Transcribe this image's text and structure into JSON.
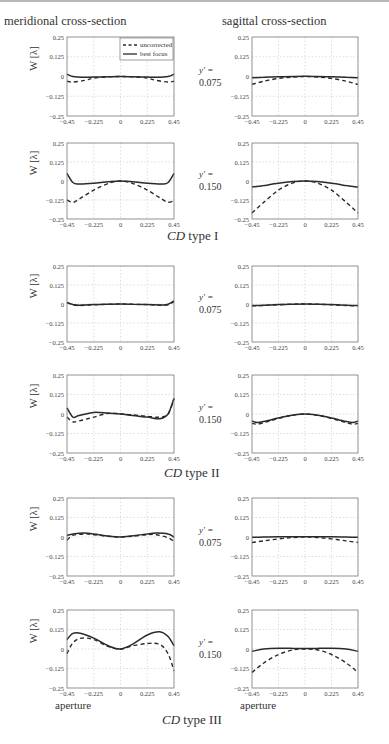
{
  "header": {
    "left_column": "meridional cross-section",
    "right_column": "sagittal cross-section"
  },
  "legend": {
    "uncorrected": "uncorrected",
    "best_focus": "best focus"
  },
  "axis": {
    "ylabel": "W [λ]",
    "xlabel": "aperture",
    "yticks": [
      "0.25",
      "0.125",
      "0",
      "−0.125",
      "−0.25"
    ],
    "xticks": [
      "−0.45",
      "−0.225",
      "0",
      "0.225",
      "0.45"
    ]
  },
  "captions": {
    "type1": {
      "italic": "CD",
      "rest": " type I"
    },
    "type2": {
      "italic": "CD",
      "rest": " type II"
    },
    "type3": {
      "italic": "CD",
      "rest": " type III"
    }
  },
  "yprime": {
    "label": "y′ =",
    "v1": "0.075",
    "v2": "0.150"
  },
  "chart_data": [
    {
      "type": "line",
      "title": "CD type I, meridional, y' = 0.075",
      "xlabel": "",
      "ylabel": "W [λ]",
      "xlim": [
        -0.45,
        0.45
      ],
      "ylim": [
        -0.25,
        0.25
      ],
      "grid": true,
      "legend_position": "upper right",
      "x": [
        -0.45,
        -0.4,
        -0.3,
        -0.225,
        -0.1,
        0,
        0.1,
        0.225,
        0.3,
        0.4,
        0.45
      ],
      "series": [
        {
          "name": "uncorrected",
          "values": [
            -0.03,
            -0.035,
            -0.025,
            -0.01,
            -0.002,
            0,
            -0.002,
            -0.01,
            -0.025,
            -0.035,
            -0.03
          ]
        },
        {
          "name": "best focus",
          "values": [
            0.015,
            0.0,
            -0.005,
            -0.004,
            -0.001,
            0,
            -0.001,
            -0.004,
            -0.005,
            0.0,
            0.015
          ]
        }
      ]
    },
    {
      "type": "line",
      "title": "CD type I, sagittal, y' = 0.075",
      "xlabel": "",
      "ylabel": "",
      "xlim": [
        -0.45,
        0.45
      ],
      "ylim": [
        -0.25,
        0.25
      ],
      "grid": true,
      "x": [
        -0.45,
        -0.35,
        -0.225,
        -0.1,
        0,
        0.1,
        0.225,
        0.35,
        0.45
      ],
      "series": [
        {
          "name": "uncorrected",
          "values": [
            -0.05,
            -0.03,
            -0.012,
            -0.003,
            0,
            -0.003,
            -0.012,
            -0.03,
            -0.05
          ]
        },
        {
          "name": "best focus",
          "values": [
            -0.008,
            -0.005,
            -0.002,
            0.0,
            0.001,
            0.0,
            -0.002,
            -0.005,
            -0.008
          ]
        }
      ]
    },
    {
      "type": "line",
      "title": "CD type I, meridional, y' = 0.150",
      "xlabel": "",
      "ylabel": "W [λ]",
      "xlim": [
        -0.45,
        0.45
      ],
      "ylim": [
        -0.25,
        0.25
      ],
      "grid": true,
      "x": [
        -0.45,
        -0.4,
        -0.35,
        -0.225,
        -0.1,
        0,
        0.1,
        0.225,
        0.35,
        0.4,
        0.45
      ],
      "series": [
        {
          "name": "uncorrected",
          "values": [
            -0.125,
            -0.14,
            -0.12,
            -0.06,
            -0.015,
            0,
            -0.015,
            -0.06,
            -0.12,
            -0.14,
            -0.13
          ]
        },
        {
          "name": "best focus",
          "values": [
            0.05,
            -0.01,
            -0.02,
            -0.015,
            -0.005,
            0,
            -0.005,
            -0.015,
            -0.02,
            -0.01,
            0.05
          ]
        }
      ]
    },
    {
      "type": "line",
      "title": "CD type I, sagittal, y' = 0.150",
      "xlabel": "",
      "ylabel": "",
      "xlim": [
        -0.45,
        0.45
      ],
      "ylim": [
        -0.25,
        0.25
      ],
      "grid": true,
      "x": [
        -0.45,
        -0.35,
        -0.225,
        -0.1,
        0,
        0.1,
        0.225,
        0.35,
        0.45
      ],
      "series": [
        {
          "name": "uncorrected",
          "values": [
            -0.21,
            -0.14,
            -0.06,
            -0.012,
            0,
            -0.012,
            -0.06,
            -0.14,
            -0.21
          ]
        },
        {
          "name": "best focus",
          "values": [
            -0.04,
            -0.03,
            -0.015,
            -0.004,
            0,
            -0.004,
            -0.015,
            -0.03,
            -0.04
          ]
        }
      ]
    },
    {
      "type": "line",
      "title": "CD type II, meridional, y' = 0.075",
      "xlabel": "",
      "ylabel": "W [λ]",
      "xlim": [
        -0.45,
        0.45
      ],
      "ylim": [
        -0.25,
        0.25
      ],
      "grid": true,
      "x": [
        -0.45,
        -0.4,
        -0.35,
        -0.225,
        -0.1,
        0,
        0.1,
        0.225,
        0.35,
        0.4,
        0.45
      ],
      "series": [
        {
          "name": "uncorrected",
          "values": [
            0.01,
            -0.005,
            -0.01,
            -0.005,
            -0.002,
            0,
            -0.002,
            -0.004,
            -0.008,
            -0.005,
            0.015
          ]
        },
        {
          "name": "best focus",
          "values": [
            0.01,
            -0.003,
            -0.008,
            -0.004,
            -0.001,
            0,
            -0.001,
            -0.003,
            -0.006,
            -0.002,
            0.02
          ]
        }
      ]
    },
    {
      "type": "line",
      "title": "CD type II, sagittal, y' = 0.075",
      "xlabel": "",
      "ylabel": "",
      "xlim": [
        -0.45,
        0.45
      ],
      "ylim": [
        -0.25,
        0.25
      ],
      "grid": true,
      "x": [
        -0.45,
        -0.35,
        -0.225,
        -0.1,
        0,
        0.1,
        0.225,
        0.35,
        0.45
      ],
      "series": [
        {
          "name": "uncorrected",
          "values": [
            -0.012,
            -0.01,
            -0.005,
            -0.001,
            0,
            -0.001,
            -0.005,
            -0.01,
            -0.012
          ]
        },
        {
          "name": "best focus",
          "values": [
            -0.01,
            -0.008,
            -0.004,
            -0.001,
            0,
            -0.001,
            -0.004,
            -0.008,
            -0.01
          ]
        }
      ]
    },
    {
      "type": "line",
      "title": "CD type II, meridional, y' = 0.150",
      "xlabel": "",
      "ylabel": "W [λ]",
      "xlim": [
        -0.45,
        0.45
      ],
      "ylim": [
        -0.25,
        0.25
      ],
      "grid": true,
      "x": [
        -0.45,
        -0.4,
        -0.35,
        -0.225,
        -0.1,
        0,
        0.1,
        0.225,
        0.33,
        0.4,
        0.45
      ],
      "series": [
        {
          "name": "uncorrected",
          "values": [
            -0.02,
            -0.05,
            -0.045,
            -0.02,
            0.005,
            0,
            -0.005,
            -0.015,
            -0.02,
            0.0,
            0.1
          ]
        },
        {
          "name": "best focus",
          "values": [
            0.04,
            -0.02,
            -0.01,
            0.01,
            0.005,
            0,
            -0.01,
            -0.02,
            -0.03,
            0.0,
            0.1
          ]
        }
      ]
    },
    {
      "type": "line",
      "title": "CD type II, sagittal, y' = 0.150",
      "xlabel": "",
      "ylabel": "",
      "xlim": [
        -0.45,
        0.45
      ],
      "ylim": [
        -0.25,
        0.25
      ],
      "grid": true,
      "x": [
        -0.45,
        -0.4,
        -0.3,
        -0.15,
        0,
        0.15,
        0.3,
        0.4,
        0.45
      ],
      "series": [
        {
          "name": "uncorrected",
          "values": [
            -0.06,
            -0.065,
            -0.045,
            -0.015,
            0,
            -0.015,
            -0.045,
            -0.065,
            -0.06
          ]
        },
        {
          "name": "best focus",
          "values": [
            -0.045,
            -0.055,
            -0.04,
            -0.012,
            0,
            -0.012,
            -0.04,
            -0.055,
            -0.045
          ]
        }
      ]
    },
    {
      "type": "line",
      "title": "CD type III, meridional, y' = 0.075",
      "xlabel": "",
      "ylabel": "W [λ]",
      "xlim": [
        -0.45,
        0.45
      ],
      "ylim": [
        -0.25,
        0.25
      ],
      "grid": true,
      "x": [
        -0.45,
        -0.4,
        -0.3,
        -0.225,
        -0.1,
        0,
        0.1,
        0.225,
        0.3,
        0.4,
        0.45
      ],
      "series": [
        {
          "name": "uncorrected",
          "values": [
            -0.02,
            0.01,
            0.02,
            0.015,
            0.005,
            0,
            0.005,
            0.015,
            0.015,
            -0.005,
            -0.03
          ]
        },
        {
          "name": "best focus",
          "values": [
            0.01,
            0.02,
            0.025,
            0.02,
            0.005,
            0,
            0.008,
            0.02,
            0.025,
            0.02,
            0.0
          ]
        }
      ]
    },
    {
      "type": "line",
      "title": "CD type III, sagittal, y' = 0.075",
      "xlabel": "",
      "ylabel": "",
      "xlim": [
        -0.45,
        0.45
      ],
      "ylim": [
        -0.25,
        0.25
      ],
      "grid": true,
      "x": [
        -0.45,
        -0.35,
        -0.225,
        -0.1,
        0,
        0.1,
        0.225,
        0.35,
        0.45
      ],
      "series": [
        {
          "name": "uncorrected",
          "values": [
            -0.035,
            -0.025,
            -0.012,
            -0.003,
            0,
            -0.003,
            -0.012,
            -0.025,
            -0.035
          ]
        },
        {
          "name": "best focus",
          "values": [
            -0.002,
            0.0,
            0.002,
            0.002,
            0.002,
            0.002,
            0.002,
            0.0,
            -0.002
          ]
        }
      ]
    },
    {
      "type": "line",
      "title": "CD type III, meridional, y' = 0.150",
      "xlabel": "aperture",
      "ylabel": "W [λ]",
      "xlim": [
        -0.45,
        0.45
      ],
      "ylim": [
        -0.25,
        0.25
      ],
      "grid": true,
      "x": [
        -0.45,
        -0.4,
        -0.33,
        -0.225,
        -0.1,
        0,
        0.1,
        0.225,
        0.33,
        0.4,
        0.45
      ],
      "series": [
        {
          "name": "uncorrected",
          "values": [
            -0.03,
            0.04,
            0.07,
            0.06,
            0.015,
            0,
            0.02,
            0.035,
            0.03,
            -0.03,
            -0.14
          ]
        },
        {
          "name": "best focus",
          "values": [
            0.06,
            0.1,
            0.1,
            0.07,
            0.02,
            0,
            0.03,
            0.09,
            0.11,
            0.08,
            0.02
          ]
        }
      ]
    },
    {
      "type": "line",
      "title": "CD type III, sagittal, y' = 0.150",
      "xlabel": "aperture",
      "ylabel": "",
      "xlim": [
        -0.45,
        0.45
      ],
      "ylim": [
        -0.25,
        0.25
      ],
      "grid": true,
      "x": [
        -0.45,
        -0.35,
        -0.225,
        -0.1,
        0,
        0.1,
        0.225,
        0.35,
        0.45
      ],
      "series": [
        {
          "name": "uncorrected",
          "values": [
            -0.15,
            -0.09,
            -0.035,
            -0.005,
            0,
            -0.005,
            -0.035,
            -0.09,
            -0.15
          ]
        },
        {
          "name": "best focus",
          "values": [
            -0.015,
            0.0,
            0.005,
            0.004,
            0.003,
            0.004,
            0.005,
            0.0,
            -0.015
          ]
        }
      ]
    }
  ]
}
